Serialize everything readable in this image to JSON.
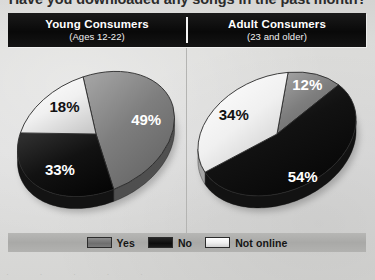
{
  "title": {
    "question": "Have you downloaded any songs in the past month?"
  },
  "header": {
    "columns": [
      {
        "name": "Young Consumers",
        "subtitle": "(Ages 12-22)"
      },
      {
        "name": "Adult Consumers",
        "subtitle": "(23 and older)"
      }
    ]
  },
  "legend": {
    "items": [
      {
        "label": "Yes",
        "swatch": "yes-swatch",
        "color": "#6e6e6e"
      },
      {
        "label": "No",
        "swatch": "no-swatch",
        "color": "#101010"
      },
      {
        "label": "Not online",
        "swatch": "not-online-swatch",
        "color": "#efefef"
      }
    ]
  },
  "footer": {
    "strip": "· · · · ·"
  },
  "colors": {
    "background": "#dedede",
    "header_bar": "#101010",
    "legend_band": "#aeaeac",
    "yes": "#6e6e6e",
    "no": "#101010",
    "not_online": "#efefef",
    "label_light": "#ffffff",
    "label_dark": "#111111"
  },
  "chart_data": [
    {
      "type": "pie",
      "title": "Young Consumers",
      "subtitle": "(Ages 12-22)",
      "categories": [
        "Yes",
        "No",
        "Not online"
      ],
      "values": [
        49,
        33,
        18
      ],
      "labels": [
        "49%",
        "33%",
        "18%"
      ],
      "label_colors": [
        "#ffffff",
        "#ffffff",
        "#111111"
      ],
      "slice_colors": [
        "#6e6e6e",
        "#101010",
        "#efefef"
      ],
      "legend_position": "bottom",
      "grid": false
    },
    {
      "type": "pie",
      "title": "Adult Consumers",
      "subtitle": "(23 and older)",
      "categories": [
        "Yes",
        "No",
        "Not online"
      ],
      "values": [
        12,
        54,
        34
      ],
      "labels": [
        "12%",
        "54%",
        "34%"
      ],
      "label_colors": [
        "#ffffff",
        "#ffffff",
        "#111111"
      ],
      "slice_colors": [
        "#6e6e6e",
        "#101010",
        "#efefef"
      ],
      "legend_position": "bottom",
      "grid": false
    }
  ]
}
